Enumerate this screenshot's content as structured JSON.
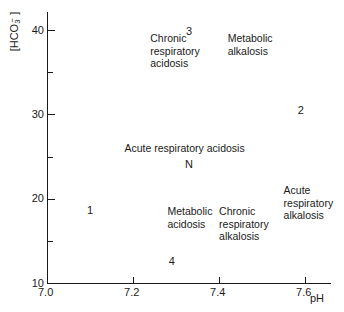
{
  "chart_data": {
    "type": "scatter",
    "title": "",
    "xlabel": "pH",
    "ylabel": "[HCO3-]",
    "ylabel_base": "[HCO",
    "ylabel_sub": "3",
    "ylabel_sup": "−",
    "ylabel_close": "]",
    "xlim": [
      7.0,
      7.7
    ],
    "ylim": [
      10,
      42
    ],
    "grid": false,
    "legend": "none",
    "x_ticks": [
      {
        "value": 7.0,
        "label": "7.0"
      },
      {
        "value": 7.2,
        "label": "7.2"
      },
      {
        "value": 7.4,
        "label": "7.4"
      },
      {
        "value": 7.6,
        "label": "7.6"
      }
    ],
    "y_ticks_major": [
      {
        "value": 40,
        "label": "40"
      },
      {
        "value": 30,
        "label": "30"
      },
      {
        "value": 20,
        "label": "20"
      },
      {
        "value": 10,
        "label": "10"
      }
    ],
    "y_ticks_minor": [
      {
        "value": 35,
        "label": ""
      },
      {
        "value": 25,
        "label": ""
      },
      {
        "value": 15,
        "label": ""
      }
    ],
    "points": [
      {
        "label": "3",
        "x": 7.33,
        "y": 39.8
      },
      {
        "label": "2",
        "x": 7.59,
        "y": 30.5
      },
      {
        "label": "N",
        "x": 7.33,
        "y": 24.0
      },
      {
        "label": "1",
        "x": 7.1,
        "y": 18.6
      },
      {
        "label": "4",
        "x": 7.29,
        "y": 12.5
      }
    ],
    "annotations": [
      {
        "name": "chronic-respiratory-acidosis",
        "text": "Chronic\nrespiratory\nacidosis",
        "x": 7.24,
        "y": 39.0
      },
      {
        "name": "metabolic-alkalosis",
        "text": "Metabolic\nalkalosis",
        "x": 7.42,
        "y": 39.0
      },
      {
        "name": "acute-respiratory-acidosis",
        "text": "Acute respiratory acidosis",
        "x": 7.18,
        "y": 26.0
      },
      {
        "name": "acute-respiratory-alkalosis",
        "text": "Acute respiratory\nalkalosis",
        "x": 7.55,
        "y": 21.0
      },
      {
        "name": "metabolic-acidosis",
        "text": "Metabolic\nacidosis",
        "x": 7.28,
        "y": 18.5
      },
      {
        "name": "chronic-respiratory-alkalosis",
        "text": "Chronic\nrespiratory\nalkalosis",
        "x": 7.4,
        "y": 18.5
      }
    ]
  },
  "axes": {
    "y_title_text": "[HCO3]",
    "x_title_text": "pH"
  }
}
